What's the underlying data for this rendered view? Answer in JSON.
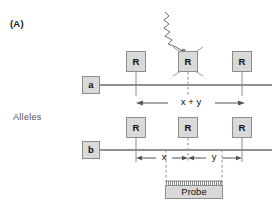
{
  "figure": {
    "panel_label": "(A)",
    "group_label": "Alleles",
    "background_color": "#ffffff",
    "line_color": "#6b6b6b",
    "box_fill": "#d9d9d9",
    "box_stroke": "#8c8c8c"
  },
  "alleles": [
    {
      "id": "a",
      "name": "a",
      "sites": [
        {
          "label": "R",
          "state": "intact"
        },
        {
          "label": "R",
          "state": "destroyed"
        },
        {
          "label": "R",
          "state": "intact"
        }
      ],
      "measurement": {
        "label": "x + y",
        "from_site": 0,
        "to_site": 2
      },
      "mutagen": {
        "icon": "squiggly-arrow-icon",
        "target_site": 1
      }
    },
    {
      "id": "b",
      "name": "b",
      "sites": [
        {
          "label": "R",
          "state": "intact"
        },
        {
          "label": "R",
          "state": "intact"
        },
        {
          "label": "R",
          "state": "intact"
        }
      ],
      "measurements": [
        {
          "label": "x",
          "from_site": 0,
          "to_site": 1
        },
        {
          "label": "y",
          "from_site": 1,
          "to_site": 2
        }
      ]
    }
  ],
  "probe": {
    "label": "Probe",
    "hatch_icon": "comb-hatch-icon"
  }
}
